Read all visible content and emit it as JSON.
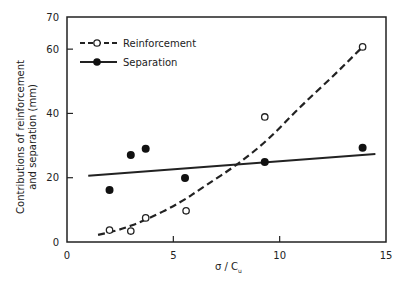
{
  "chart_data": {
    "type": "scatter",
    "title": "",
    "xlabel": "σ / Cu",
    "xlabel_main": "σ / C",
    "xlabel_sub": "u",
    "ylabel": "Contributions of reinforcement and separation (mm)",
    "ylabel_line1": "Contributions of reinforcement",
    "ylabel_line2": "and separation (mm)",
    "xlim": [
      0,
      15
    ],
    "ylim": [
      0,
      70
    ],
    "xticks": [
      0,
      5,
      10,
      15
    ],
    "yticks": [
      0,
      20,
      40,
      60,
      70
    ],
    "grid": false,
    "legend_position": "upper left",
    "series": [
      {
        "name": "Reinforcement",
        "marker": "open-circle",
        "line_style": "dashed",
        "points": [
          {
            "x": 2.0,
            "y": 3.7
          },
          {
            "x": 3.0,
            "y": 3.4
          },
          {
            "x": 3.7,
            "y": 7.5
          },
          {
            "x": 5.6,
            "y": 9.7
          },
          {
            "x": 9.3,
            "y": 38.9
          },
          {
            "x": 13.9,
            "y": 60.7
          }
        ],
        "fit_curve": [
          {
            "x": 1.46,
            "y": 2.2
          },
          {
            "x": 2.5,
            "y": 3.8
          },
          {
            "x": 3.7,
            "y": 6.8
          },
          {
            "x": 5.3,
            "y": 12.1
          },
          {
            "x": 6.5,
            "y": 17.5
          },
          {
            "x": 8.0,
            "y": 24.0
          },
          {
            "x": 9.5,
            "y": 32.0
          },
          {
            "x": 10.95,
            "y": 42.0
          },
          {
            "x": 12.5,
            "y": 51.5
          },
          {
            "x": 13.9,
            "y": 60.7
          }
        ]
      },
      {
        "name": "Separation",
        "marker": "filled-circle",
        "line_style": "solid",
        "points": [
          {
            "x": 2.0,
            "y": 16.2
          },
          {
            "x": 3.0,
            "y": 27.1
          },
          {
            "x": 3.7,
            "y": 29.0
          },
          {
            "x": 5.55,
            "y": 19.9
          },
          {
            "x": 9.3,
            "y": 24.9
          },
          {
            "x": 13.9,
            "y": 29.3
          }
        ],
        "fit_line": [
          {
            "x": 1.0,
            "y": 20.6
          },
          {
            "x": 14.5,
            "y": 27.4
          }
        ]
      }
    ]
  },
  "legend": {
    "items": [
      {
        "label": "Reinforcement"
      },
      {
        "label": "Separation"
      }
    ]
  }
}
